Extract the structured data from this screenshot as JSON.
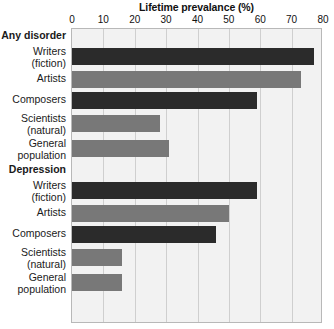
{
  "chart_data": {
    "type": "bar",
    "orientation": "horizontal",
    "title": "Lifetime prevalance (%)",
    "xlabel": "Lifetime prevalance (%)",
    "ylabel": "",
    "xlim": [
      0,
      80
    ],
    "xticks": [
      0,
      10,
      20,
      30,
      40,
      50,
      60,
      70,
      80
    ],
    "grid": true,
    "legend": "none",
    "groups": [
      {
        "name": "Any disorder",
        "categories": [
          "Writers (fiction)",
          "Artists",
          "Composers",
          "Scientists (natural)",
          "General population"
        ],
        "values": [
          77,
          73,
          59,
          28,
          31
        ]
      },
      {
        "name": "Depression",
        "categories": [
          "Writers (fiction)",
          "Artists",
          "Composers",
          "Scientists (natural)",
          "General population"
        ],
        "values": [
          59,
          50,
          46,
          16,
          16
        ]
      }
    ],
    "colors": {
      "dark": "#2b2b2b",
      "light": "#787878",
      "plot_background": "#f2f2f2",
      "gridline": "#cfcfcf",
      "frame": "#b8b8b8"
    }
  },
  "axis": {
    "title": "Lifetime prevalance (%)",
    "ticks": [
      "0",
      "10",
      "20",
      "30",
      "40",
      "50",
      "60",
      "70",
      "80"
    ]
  },
  "rows": [
    {
      "label1": "Any disorder",
      "label2": "",
      "kind": "group"
    },
    {
      "label1": "Writers",
      "label2": "(fiction)",
      "kind": "bar",
      "value": 77,
      "shade": "dark"
    },
    {
      "label1": "Artists",
      "label2": "",
      "kind": "bar",
      "value": 73,
      "shade": "light"
    },
    {
      "label1": "Composers",
      "label2": "",
      "kind": "bar",
      "value": 59,
      "shade": "dark"
    },
    {
      "label1": "Scientists",
      "label2": "(natural)",
      "kind": "bar",
      "value": 28,
      "shade": "light"
    },
    {
      "label1": "General",
      "label2": "population",
      "kind": "bar",
      "value": 31,
      "shade": "light"
    },
    {
      "label1": "Depression",
      "label2": "",
      "kind": "group"
    },
    {
      "label1": "Writers",
      "label2": "(fiction)",
      "kind": "bar",
      "value": 59,
      "shade": "dark"
    },
    {
      "label1": "Artists",
      "label2": "",
      "kind": "bar",
      "value": 50,
      "shade": "light"
    },
    {
      "label1": "Composers",
      "label2": "",
      "kind": "bar",
      "value": 46,
      "shade": "dark"
    },
    {
      "label1": "Scientists",
      "label2": "(natural)",
      "kind": "bar",
      "value": 16,
      "shade": "light"
    },
    {
      "label1": "General",
      "label2": "population",
      "kind": "bar",
      "value": 16,
      "shade": "light"
    }
  ]
}
